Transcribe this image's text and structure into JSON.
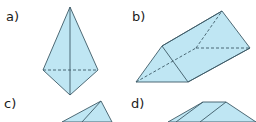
{
  "labels": {
    "a": "a)",
    "b": "b)",
    "c": "c)",
    "d": "d)"
  },
  "colors": {
    "fill": "#bfe6f3",
    "stroke": "#3d5a66",
    "hidden_edge": "#3d5a66"
  },
  "figures": [
    {
      "id": "a",
      "shape": "triangular-bipyramid"
    },
    {
      "id": "b",
      "shape": "triangular-prism"
    },
    {
      "id": "c",
      "shape": "pyramid (partially visible)"
    },
    {
      "id": "d",
      "shape": "prism (partially visible)"
    }
  ]
}
